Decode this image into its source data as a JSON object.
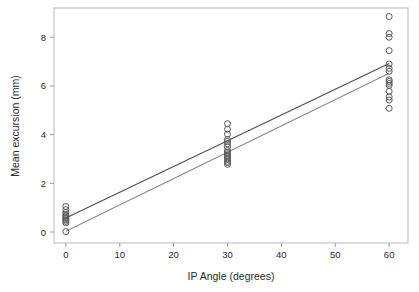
{
  "chart_data": {
    "type": "scatter",
    "title": "",
    "xlabel": "IP Angle (degrees)",
    "ylabel": "Mean excursion (mm)",
    "xlim": [
      -2.2,
      63.5
    ],
    "ylim": [
      -0.45,
      9.2
    ],
    "xticks": [
      0,
      10,
      20,
      30,
      40,
      50,
      60
    ],
    "xtick_labels": [
      "0",
      "10",
      "20",
      "30",
      "40",
      "50",
      "60"
    ],
    "yticks": [
      0,
      2,
      4,
      6,
      8
    ],
    "ytick_labels": [
      "0",
      "2",
      "4",
      "6",
      "8"
    ],
    "grid": false,
    "legend": "none",
    "frame": true,
    "marker": "open-circle",
    "marker_radius_px": 3.0,
    "marker_color": "#5a5a5a",
    "series": [
      {
        "name": "Mean excursion observations",
        "x": [
          0,
          0,
          0,
          0,
          0,
          0,
          0,
          0,
          0,
          0,
          0,
          30,
          30,
          30,
          30,
          30,
          30,
          30,
          30,
          30,
          30,
          30,
          30,
          30,
          30,
          30,
          30,
          30,
          60,
          60,
          60,
          60,
          60,
          60,
          60,
          60,
          60,
          60,
          60,
          60,
          60,
          60,
          60
        ],
        "y": [
          1.05,
          0.92,
          0.8,
          0.72,
          0.66,
          0.6,
          0.55,
          0.5,
          0.44,
          0.38,
          0.02,
          4.45,
          4.22,
          4.02,
          3.8,
          3.72,
          3.62,
          3.5,
          3.35,
          3.28,
          3.22,
          3.16,
          3.1,
          3.04,
          2.98,
          2.9,
          2.85,
          2.78,
          8.85,
          8.15,
          8.0,
          7.45,
          6.9,
          6.72,
          6.6,
          6.25,
          6.18,
          6.1,
          6.02,
          5.78,
          5.55,
          5.42,
          5.08
        ]
      }
    ],
    "regression_lines": [
      {
        "name": "upper-fit-line",
        "color": "#4d4d4d",
        "x0": 0,
        "y0": 0.58,
        "x1": 60,
        "y1": 6.92,
        "slope": 0.1057,
        "intercept": 0.58
      },
      {
        "name": "lower-fit-line",
        "color": "#8a8a8a",
        "x0": 0,
        "y0": 0.03,
        "x1": 60,
        "y1": 6.52,
        "slope": 0.1082,
        "intercept": 0.03
      }
    ],
    "colors": {
      "background": "#ffffff",
      "frame": "#b9b9b9",
      "tick": "#9a9a9a",
      "text": "#2b2b2b",
      "marker": "#5a5a5a",
      "line_dark": "#4d4d4d",
      "line_light": "#8a8a8a"
    },
    "geometry": {
      "left_px": 54,
      "right_px": 408,
      "top_px": 8,
      "bottom_px": 243
    }
  }
}
